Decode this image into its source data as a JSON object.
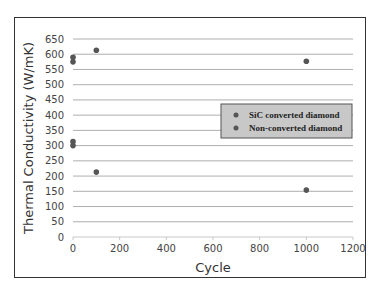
{
  "chart_data": {
    "type": "scatter",
    "title": "",
    "xlabel": "Cycle",
    "ylabel": "Thermal Conductivity (W/mK)",
    "xlim": [
      0,
      1200
    ],
    "ylim": [
      0,
      650
    ],
    "x_ticks": [
      0,
      200,
      400,
      600,
      800,
      1000,
      1200
    ],
    "y_ticks": [
      0,
      50,
      100,
      150,
      200,
      250,
      300,
      350,
      400,
      450,
      500,
      550,
      600,
      650
    ],
    "grid": "horizontal",
    "legend_position": "right-center inside",
    "series": [
      {
        "name": "SiC converted diamond",
        "color": "#555555",
        "points": [
          [
            0,
            590
          ],
          [
            0,
            575
          ],
          [
            100,
            613
          ],
          [
            1000,
            577
          ]
        ]
      },
      {
        "name": "Non-converted diamond",
        "color": "#555555",
        "points": [
          [
            0,
            313
          ],
          [
            0,
            300
          ],
          [
            100,
            213
          ],
          [
            1000,
            154
          ]
        ]
      }
    ]
  },
  "legend": {
    "items": [
      "SiC converted diamond",
      "Non-converted diamond"
    ],
    "background": "#c8c8c8"
  }
}
